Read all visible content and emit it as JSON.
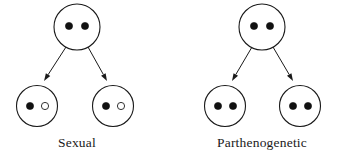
{
  "figure": {
    "background_color": "#ffffff",
    "stroke_color": "#1a1a1a",
    "filled_allele_color": "#111111",
    "hollow_allele_color": "#ffffff"
  },
  "groups": [
    {
      "id": "sexual",
      "caption": "Sexual",
      "caption_x": 77,
      "caption_y": 147,
      "parent": {
        "name": "parent-cell",
        "cx": 77,
        "cy": 27,
        "r": 23,
        "alleles": [
          {
            "type": "filled",
            "cx": 69,
            "cy": 26,
            "r": 3.6
          },
          {
            "type": "filled",
            "cx": 85,
            "cy": 26,
            "r": 3.6
          }
        ]
      },
      "offspring": [
        {
          "name": "offspring-cell-left",
          "cx": 37,
          "cy": 106,
          "r": 20.5,
          "alleles": [
            {
              "type": "filled",
              "cx": 30,
              "cy": 106,
              "r": 3.6
            },
            {
              "type": "hollow",
              "cx": 45,
              "cy": 106,
              "r": 3.6
            }
          ]
        },
        {
          "name": "offspring-cell-right",
          "cx": 113,
          "cy": 106,
          "r": 20.5,
          "alleles": [
            {
              "type": "filled",
              "cx": 106,
              "cy": 106,
              "r": 3.6
            },
            {
              "type": "hollow",
              "cx": 121,
              "cy": 106,
              "r": 3.6
            }
          ]
        }
      ],
      "arrows": [
        {
          "name": "arrow-to-left-offspring",
          "x1": 66,
          "y1": 47,
          "x2": 44,
          "y2": 81
        },
        {
          "name": "arrow-to-right-offspring",
          "x1": 88,
          "y1": 47,
          "x2": 107,
          "y2": 81
        }
      ]
    },
    {
      "id": "parthenogenetic",
      "caption": "Parthenogenetic",
      "caption_x": 262,
      "caption_y": 147,
      "parent": {
        "name": "parent-cell",
        "cx": 262,
        "cy": 27,
        "r": 23,
        "alleles": [
          {
            "type": "filled",
            "cx": 254,
            "cy": 26,
            "r": 3.6
          },
          {
            "type": "filled",
            "cx": 270,
            "cy": 26,
            "r": 3.6
          }
        ]
      },
      "offspring": [
        {
          "name": "offspring-cell-left",
          "cx": 225,
          "cy": 106,
          "r": 20.5,
          "alleles": [
            {
              "type": "filled",
              "cx": 218,
              "cy": 106,
              "r": 3.6
            },
            {
              "type": "filled",
              "cx": 233,
              "cy": 106,
              "r": 3.6
            }
          ]
        },
        {
          "name": "offspring-cell-right",
          "cx": 300,
          "cy": 106,
          "r": 20.5,
          "alleles": [
            {
              "type": "filled",
              "cx": 293,
              "cy": 106,
              "r": 3.6
            },
            {
              "type": "filled",
              "cx": 308,
              "cy": 106,
              "r": 3.6
            }
          ]
        }
      ],
      "arrows": [
        {
          "name": "arrow-to-left-offspring",
          "x1": 252,
          "y1": 47,
          "x2": 232,
          "y2": 81
        },
        {
          "name": "arrow-to-right-offspring",
          "x1": 273,
          "y1": 47,
          "x2": 293,
          "y2": 81
        }
      ]
    }
  ]
}
